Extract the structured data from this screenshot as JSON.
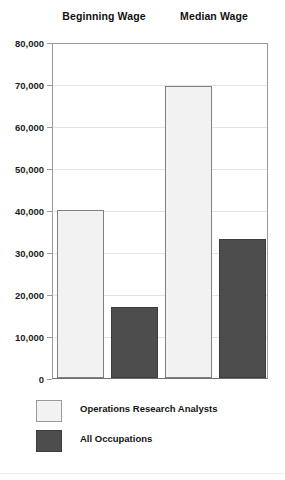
{
  "chart_data": {
    "type": "bar",
    "title": "",
    "xlabel": "",
    "ylabel": "",
    "categories": [
      "Beginning Wage",
      "Median Wage"
    ],
    "series": [
      {
        "name": "Operations Research Analysts",
        "color": "#f2f2f2",
        "values": [
          40000,
          69500
        ]
      },
      {
        "name": "All Occupations",
        "color": "#4d4d4d",
        "values": [
          16900,
          33100
        ]
      }
    ],
    "ylim": [
      0,
      80000
    ],
    "ytick_step": 10000,
    "ytick_labels": [
      "80,000",
      "70,000",
      "60,000",
      "50,000",
      "40,000",
      "30,000",
      "20,000",
      "10,000",
      "0"
    ],
    "ytick_values": [
      80000,
      70000,
      60000,
      50000,
      40000,
      30000,
      20000,
      10000,
      0
    ],
    "grid": true,
    "legend_position": "bottom-left"
  },
  "legend": {
    "items": [
      {
        "label": "Operations Research Analysts",
        "swatch": "light"
      },
      {
        "label": "All Occupations",
        "swatch": "dark"
      }
    ]
  }
}
